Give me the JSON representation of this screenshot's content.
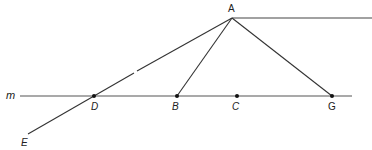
{
  "figure": {
    "type": "geometry",
    "line_label": "m",
    "points": [
      {
        "id": "A",
        "label": "A",
        "x": 232,
        "y": 18
      },
      {
        "id": "D",
        "label": "D",
        "x": 94,
        "y": 96
      },
      {
        "id": "B",
        "label": "B",
        "x": 177,
        "y": 96
      },
      {
        "id": "C",
        "label": "C",
        "x": 237,
        "y": 96
      },
      {
        "id": "G",
        "label": "G",
        "x": 332,
        "y": 96
      },
      {
        "id": "E",
        "label": "E",
        "x": 28,
        "y": 134
      }
    ],
    "segments": [
      {
        "from": "A",
        "to": "E",
        "note": "passes through D"
      },
      {
        "from": "A",
        "to": "B"
      },
      {
        "from": "A",
        "to": "G"
      },
      {
        "from": "A",
        "to": "ray-end",
        "note": "horizontal ray to the right"
      }
    ],
    "colors": {
      "stroke": "#333333",
      "line_m": "#555555",
      "label": "#222222"
    }
  }
}
